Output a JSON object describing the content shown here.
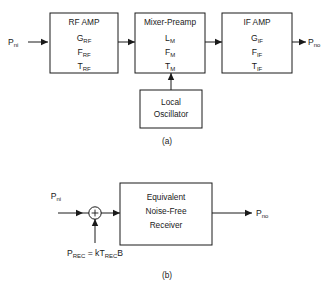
{
  "figure": {
    "panel_a": {
      "caption": "(a)",
      "input_port": {
        "base": "P",
        "sub": "ni"
      },
      "output_port": {
        "base": "P",
        "sub": "no"
      },
      "blocks": [
        {
          "id": "rf-amp",
          "title": "RF AMP",
          "params": [
            {
              "base": "G",
              "sub": "RF"
            },
            {
              "base": "F",
              "sub": "RF"
            },
            {
              "base": "T",
              "sub": "RF"
            }
          ]
        },
        {
          "id": "mixer-preamp",
          "title": "Mixer-Preamp",
          "params": [
            {
              "base": "L",
              "sub": "M"
            },
            {
              "base": "F",
              "sub": "M"
            },
            {
              "base": "T",
              "sub": "M"
            }
          ]
        },
        {
          "id": "if-amp",
          "title": "IF AMP",
          "params": [
            {
              "base": "G",
              "sub": "IF"
            },
            {
              "base": "F",
              "sub": "IF"
            },
            {
              "base": "T",
              "sub": "IF"
            }
          ]
        }
      ],
      "local_oscillator": {
        "id": "local-oscillator",
        "line1": "Local",
        "line2": "Oscillator"
      }
    },
    "panel_b": {
      "caption": "(b)",
      "input_port": {
        "base": "P",
        "sub": "ni"
      },
      "output_port": {
        "base": "P",
        "sub": "no"
      },
      "summing_junction": {
        "symbol": "+"
      },
      "noise_source_equation": {
        "base1": "P",
        "sub1": "REC",
        "operator": " = k",
        "base2": "T",
        "sub2": "REC",
        "tail": "B"
      },
      "block": {
        "id": "equivalent-noise-free-receiver",
        "line1": "Equivalent",
        "line2": "Noise-Free",
        "line3": "Receiver"
      }
    }
  },
  "colors": {
    "background": "#ffffff",
    "ink": "#1a1a1a"
  }
}
